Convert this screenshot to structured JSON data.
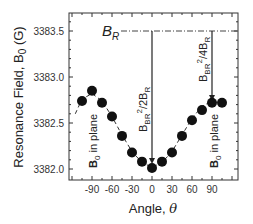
{
  "chart_data": {
    "type": "scatter",
    "title": "",
    "xlabel": "Angle, θ",
    "ylabel": "Resonance Field, B0 (G)",
    "xlim": [
      -120,
      110
    ],
    "ylim": [
      3381.95,
      3383.7
    ],
    "x_ticks": [
      -90,
      -60,
      -30,
      0,
      30,
      60,
      90
    ],
    "x_tick_labels": [
      "-90",
      "-60",
      "-30",
      "0",
      "30",
      "60",
      "90"
    ],
    "y_ticks": [
      3382.0,
      3382.5,
      3383.0,
      3383.5
    ],
    "y_tick_labels": [
      "3382.0",
      "3382.5",
      "3383.0",
      "3383.5"
    ],
    "grid": false,
    "series": [
      {
        "name": "measured",
        "marker": "filled-circle",
        "x": [
          -105,
          -90,
          -75,
          -60,
          -45,
          -30,
          -15,
          0,
          15,
          30,
          45,
          60,
          75,
          90,
          105
        ],
        "y": [
          3382.74,
          3382.85,
          3382.72,
          3382.57,
          3382.36,
          3382.18,
          3382.08,
          3382.01,
          3382.08,
          3382.18,
          3382.36,
          3382.53,
          3382.64,
          3382.72,
          3382.72
        ]
      },
      {
        "name": "fit",
        "style": "dashed",
        "x": [
          -115,
          -105,
          -90,
          -75,
          -60,
          -45,
          -30,
          -15,
          0,
          15,
          30,
          45,
          60,
          75,
          90,
          105
        ],
        "y": [
          3382.6,
          3382.76,
          3382.82,
          3382.74,
          3382.57,
          3382.37,
          3382.19,
          3382.07,
          3382.02,
          3382.07,
          3382.19,
          3382.37,
          3382.55,
          3382.68,
          3382.74,
          3382.7
        ]
      }
    ],
    "annotations": [
      {
        "text": "B_R",
        "type": "horizontal-dash-dot-line",
        "y": 3383.5
      },
      {
        "text": "B_BR^2/2B_R",
        "type": "vertical-arrow",
        "x": 0
      },
      {
        "text": "B_BR^2/4B_R",
        "type": "vertical-arrow",
        "x": 90
      },
      {
        "text": "B0 in plane",
        "x": -90,
        "rotation": -90
      },
      {
        "text": "B0 in plane",
        "x": 90,
        "rotation": -90
      }
    ]
  },
  "labels": {
    "xlabel_text": "Angle, ",
    "xlabel_symbol": "θ",
    "ylabel_text": "Resonance Field, B",
    "ylabel_sub": "0",
    "ylabel_unit": " (G)",
    "br_main": "B",
    "br_sub": "R",
    "arrow1_b": "B",
    "arrow1_sub": "BR",
    "arrow1_sup": "2",
    "arrow1_rest": "/2B",
    "arrow1_rsub": "R",
    "arrow2_b": "B",
    "arrow2_sub": "BR",
    "arrow2_sup": "2",
    "arrow2_rest": "/4B",
    "arrow2_rsub": "R",
    "inplane_b": "B",
    "inplane_sub": "0",
    "inplane_rest": " in plane"
  }
}
